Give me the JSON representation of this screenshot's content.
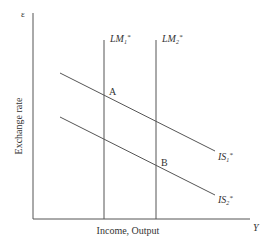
{
  "diagram": {
    "type": "Mundell-Fleming IS*-LM* diagram",
    "y_axis": {
      "symbol": "ε",
      "label": "Exchange rate"
    },
    "x_axis": {
      "symbol": "Y",
      "label": "Income, Output"
    },
    "curves": [
      {
        "id": "LM1",
        "label_base": "LM",
        "label_sub": "1",
        "label_sup": "*",
        "kind": "vertical"
      },
      {
        "id": "LM2",
        "label_base": "LM",
        "label_sub": "2",
        "label_sup": "*",
        "kind": "vertical"
      },
      {
        "id": "IS1",
        "label_base": "IS",
        "label_sub": "1",
        "label_sup": "*",
        "kind": "downward-sloping"
      },
      {
        "id": "IS2",
        "label_base": "IS",
        "label_sub": "2",
        "label_sup": "*",
        "kind": "downward-sloping"
      }
    ],
    "points": [
      {
        "label": "A",
        "at": "LM1 ∩ IS1"
      },
      {
        "label": "B",
        "at": "LM2 ∩ IS2"
      }
    ],
    "colors": {
      "line": "#555555",
      "text": "#333333"
    }
  }
}
